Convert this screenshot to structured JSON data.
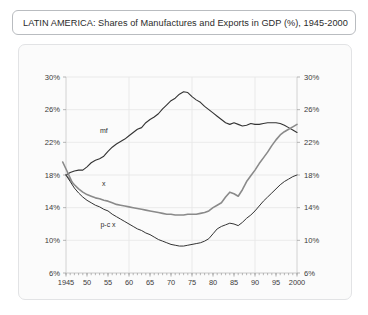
{
  "title": "LATIN AMERICA: Shares of Manufactures and Exports in GDP (%), 1945-2000",
  "chart_data": {
    "type": "line",
    "title": "LATIN AMERICA: Shares of Manufactures and Exports in GDP (%), 1945-2000",
    "xlabel": "",
    "ylabel": "",
    "xlim": [
      1945,
      2000
    ],
    "ylim": [
      6,
      30
    ],
    "yticks": [
      "6%",
      "10%",
      "14%",
      "18%",
      "22%",
      "26%",
      "30%"
    ],
    "ytick_values": [
      6,
      10,
      14,
      18,
      22,
      26,
      30
    ],
    "xticks": [
      "1945",
      "50",
      "55",
      "60",
      "65",
      "70",
      "75",
      "80",
      "85",
      "90",
      "95",
      "2000"
    ],
    "xtick_values": [
      1945,
      1950,
      1955,
      1960,
      1965,
      1970,
      1975,
      1980,
      1985,
      1990,
      1995,
      2000
    ],
    "grid": true,
    "dual_y_axis": true,
    "legend": "inline-labels",
    "series": [
      {
        "name": "mf",
        "label": "mf",
        "color": "#333333",
        "width": 1.1,
        "label_x": 1954,
        "label_y": 23.2,
        "x": [
          1945,
          1946,
          1947,
          1948,
          1949,
          1950,
          1951,
          1952,
          1953,
          1954,
          1955,
          1956,
          1957,
          1958,
          1959,
          1960,
          1961,
          1962,
          1963,
          1964,
          1965,
          1966,
          1967,
          1968,
          1969,
          1970,
          1971,
          1972,
          1973,
          1974,
          1975,
          1976,
          1977,
          1978,
          1979,
          1980,
          1981,
          1982,
          1983,
          1984,
          1985,
          1986,
          1987,
          1988,
          1989,
          1990,
          1991,
          1992,
          1993,
          1994,
          1995,
          1996,
          1997,
          1998,
          1999,
          2000
        ],
        "y": [
          18.0,
          18.3,
          18.5,
          18.6,
          18.6,
          19.0,
          19.5,
          19.8,
          20.0,
          20.3,
          20.9,
          21.4,
          21.8,
          22.1,
          22.4,
          22.8,
          23.2,
          23.6,
          23.8,
          24.4,
          24.8,
          25.1,
          25.5,
          26.1,
          26.6,
          27.1,
          27.4,
          27.9,
          28.2,
          28.1,
          27.6,
          27.2,
          26.9,
          26.4,
          26.0,
          25.6,
          25.2,
          24.8,
          24.4,
          24.2,
          24.4,
          24.2,
          24.0,
          24.1,
          24.3,
          24.2,
          24.2,
          24.3,
          24.4,
          24.4,
          24.4,
          24.3,
          24.1,
          23.8,
          23.5,
          23.2
        ]
      },
      {
        "name": "x",
        "label": "x",
        "color": "#8a8a8a",
        "width": 1.6,
        "label_x": 1954,
        "label_y": 16.6,
        "x": [
          1945,
          1946,
          1947,
          1948,
          1949,
          1950,
          1951,
          1952,
          1953,
          1954,
          1955,
          1956,
          1957,
          1958,
          1959,
          1960,
          1961,
          1962,
          1963,
          1964,
          1965,
          1966,
          1967,
          1968,
          1969,
          1970,
          1971,
          1972,
          1973,
          1974,
          1975,
          1976,
          1977,
          1978,
          1979,
          1980,
          1981,
          1982,
          1983,
          1984,
          1985,
          1986,
          1987,
          1988,
          1989,
          1990,
          1991,
          1992,
          1993,
          1994,
          1995,
          1996,
          1997,
          1998,
          1999,
          2000
        ],
        "y": [
          18.0,
          17.4,
          16.8,
          16.3,
          15.9,
          15.6,
          15.4,
          15.2,
          15.1,
          14.9,
          14.8,
          14.6,
          14.4,
          14.3,
          14.2,
          14.1,
          14.0,
          13.9,
          13.8,
          13.7,
          13.6,
          13.5,
          13.4,
          13.3,
          13.2,
          13.2,
          13.1,
          13.1,
          13.1,
          13.2,
          13.2,
          13.2,
          13.3,
          13.4,
          13.6,
          14.0,
          14.3,
          14.6,
          15.3,
          15.9,
          15.7,
          15.4,
          16.2,
          17.2,
          17.9,
          18.6,
          19.4,
          20.1,
          20.8,
          21.6,
          22.3,
          22.9,
          23.3,
          23.6,
          23.9,
          24.2
        ]
      },
      {
        "name": "p-c x",
        "label": "p-c x",
        "color": "#333333",
        "width": 1.0,
        "label_x": 1955,
        "label_y": 11.6,
        "x": [
          1945,
          1946,
          1947,
          1948,
          1949,
          1950,
          1951,
          1952,
          1953,
          1954,
          1955,
          1956,
          1957,
          1958,
          1959,
          1960,
          1961,
          1962,
          1963,
          1964,
          1965,
          1966,
          1967,
          1968,
          1969,
          1970,
          1971,
          1972,
          1973,
          1974,
          1975,
          1976,
          1977,
          1978,
          1979,
          1980,
          1981,
          1982,
          1983,
          1984,
          1985,
          1986,
          1987,
          1988,
          1989,
          1990,
          1991,
          1992,
          1993,
          1994,
          1995,
          1996,
          1997,
          1998,
          1999,
          2000
        ],
        "y": [
          18.0,
          17.2,
          16.4,
          15.8,
          15.3,
          14.9,
          14.6,
          14.3,
          14.1,
          13.8,
          13.6,
          13.2,
          12.9,
          12.6,
          12.3,
          12.0,
          11.7,
          11.4,
          11.2,
          10.9,
          10.7,
          10.4,
          10.1,
          9.9,
          9.7,
          9.5,
          9.4,
          9.3,
          9.3,
          9.4,
          9.5,
          9.6,
          9.7,
          9.9,
          10.2,
          10.8,
          11.4,
          11.7,
          11.9,
          12.1,
          12.0,
          11.8,
          12.2,
          12.7,
          13.1,
          13.6,
          14.2,
          14.8,
          15.3,
          15.8,
          16.3,
          16.8,
          17.2,
          17.5,
          17.8,
          18.0
        ]
      }
    ]
  }
}
